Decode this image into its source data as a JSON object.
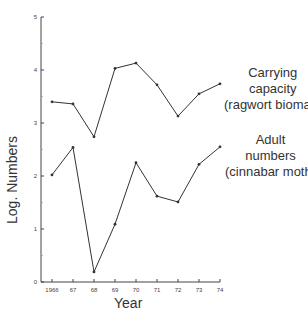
{
  "chart_data": {
    "type": "line",
    "title": "",
    "xlabel": "Year",
    "ylabel": "Log. Numbers",
    "x": [
      "1966",
      "67",
      "68",
      "69",
      "70",
      "71",
      "72",
      "73",
      "74"
    ],
    "ylim": [
      0,
      5
    ],
    "yticks": [
      "0",
      "1",
      "2",
      "3",
      "4",
      "5"
    ],
    "grid": false,
    "legend": "inline labels at right end of each line",
    "series": [
      {
        "name": "Carrying capacity (ragwort biomas)",
        "label_lines": [
          "Carrying",
          "capacity",
          "(ragwort biomas)"
        ],
        "values": [
          3.4,
          3.36,
          2.74,
          4.03,
          4.13,
          3.72,
          3.13,
          3.55,
          3.74
        ]
      },
      {
        "name": "Adult numbers (cinnabar moth)",
        "label_lines": [
          "Adult",
          "numbers",
          "(cinnabar moth)"
        ],
        "values": [
          2.02,
          2.54,
          0.19,
          1.09,
          2.25,
          1.62,
          1.51,
          2.22,
          2.55
        ]
      }
    ],
    "colors": {
      "line": "#333333",
      "axis": "#444444",
      "text": "#333333"
    }
  }
}
